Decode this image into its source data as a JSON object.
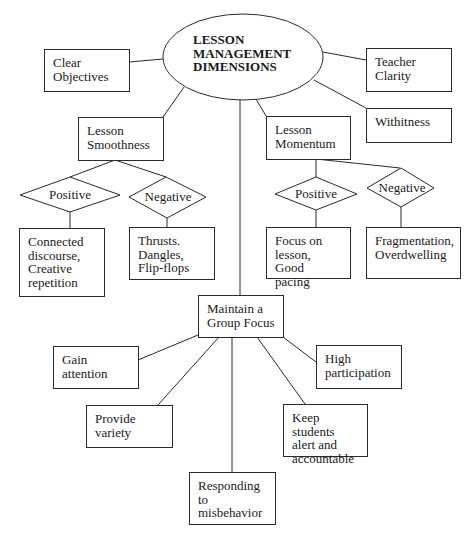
{
  "center": {
    "lines": [
      "LESSON",
      "MANAGEMENT",
      "DIMENSIONS"
    ]
  },
  "top_nodes": {
    "clear_objectives": [
      "Clear",
      "Objectives"
    ],
    "teacher_clarity": [
      "Teacher",
      "Clarity"
    ],
    "withitness": [
      "Withitness"
    ]
  },
  "smoothness": {
    "label": [
      "Lesson",
      "Smoothness"
    ],
    "positive": "Positive",
    "negative": "Negative",
    "positive_items": [
      "Connected",
      "discourse,",
      "Creative",
      "repetition"
    ],
    "negative_items": [
      "Thrusts.",
      "Dangles,",
      "Flip-flops"
    ]
  },
  "momentum": {
    "label": [
      "Lesson",
      "Momentum"
    ],
    "positive": "Positive",
    "negative": "Negative",
    "positive_items": [
      "Focus on",
      "lesson, Good",
      "pacing"
    ],
    "negative_items": [
      "Fragmentation,",
      "Overdwelling"
    ]
  },
  "group_focus": {
    "label": [
      "Maintain a",
      "Group Focus"
    ],
    "children": {
      "gain_attention": [
        "Gain",
        "attention"
      ],
      "provide_variety": [
        "Provide",
        "variety"
      ],
      "responding": [
        "Responding",
        "to",
        "misbehavior"
      ],
      "keep_students": [
        "Keep students",
        "alert and",
        "accountable"
      ],
      "high_participation": [
        "High",
        "participation"
      ]
    }
  },
  "colors": {
    "stroke": "#2a2a2a",
    "text": "#1a1a1a",
    "background": "#ffffff"
  }
}
